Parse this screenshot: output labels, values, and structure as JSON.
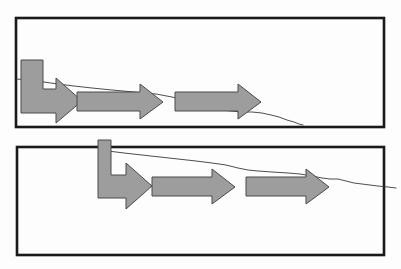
{
  "figure": {
    "width": 401,
    "height": 269,
    "background_color": "#fdfdfd",
    "border_color": "#1a1a1a",
    "arrow_fill_color": "#9d9d9d",
    "arrow_stroke_color": "#4a4a4a",
    "profile_line_color": "#3a3a3a"
  },
  "panels": [
    {
      "id": "panel-top",
      "label": "Top panel",
      "frame": {
        "x": 16,
        "y": 18,
        "width": 368,
        "height": 109,
        "stroke_width": 2.6
      },
      "profile_line": {
        "label": "upper profile line",
        "points": "16,79 30,80 44,82 58,84 74,86 92,88 112,90 134,92 156,94 172,97 186,101 196,104 204,106 212,108 221,110 231,111 241,112 252,112 262,113 271,115 279,117 287,120 294,122 299,124 303,125"
      },
      "arrows": [
        {
          "id": "elbow-arrow-1",
          "type": "elbow",
          "description": "bent arrow entering from upper left and turning right",
          "points": "21,60 43,60 43,89 56,89 56,78 82,101 56,123 56,113 21,113"
        },
        {
          "id": "straight-arrow-1",
          "type": "straight",
          "description": "horizontal block arrow, middle left",
          "points": "77,92 140,92 140,84 163,102 140,119 140,111 77,111"
        },
        {
          "id": "straight-arrow-2",
          "type": "straight",
          "description": "horizontal block arrow, middle right",
          "points": "175,92 238,92 238,84 261,102 238,119 238,111 175,111"
        }
      ]
    },
    {
      "id": "panel-bottom",
      "label": "Bottom panel",
      "frame": {
        "x": 17,
        "y": 147,
        "width": 367,
        "height": 108,
        "stroke_width": 2.6
      },
      "profile_line": {
        "label": "lower profile line",
        "points": "108,151 124,153 142,155 160,157 178,159 196,161 212,163 226,165 238,168 248,170 258,171 272,172 288,173 300,174 312,176 322,178 330,179 338,179 346,181 354,183 362,184 370,185 378,186 388,187 396,188"
      },
      "stub": {
        "id": "elbow-arrow-stub",
        "description": "small vertical stub rising above panel top border",
        "x": 98,
        "y": 140,
        "width": 13,
        "height": 10
      },
      "arrows": [
        {
          "id": "elbow-arrow-2",
          "type": "elbow",
          "description": "bent arrow entering from top and turning right",
          "points": "98,140 111,140 111,175 126,175 126,163 152,186 126,209 126,198 98,198"
        },
        {
          "id": "straight-arrow-3",
          "type": "straight",
          "description": "horizontal block arrow, bottom middle",
          "points": "152,177 212,177 212,169 235,187 212,204 212,196 152,196"
        },
        {
          "id": "straight-arrow-4",
          "type": "straight",
          "description": "horizontal block arrow, bottom right",
          "points": "246,177 306,177 306,169 329,187 306,204 306,196 246,196"
        }
      ]
    }
  ]
}
